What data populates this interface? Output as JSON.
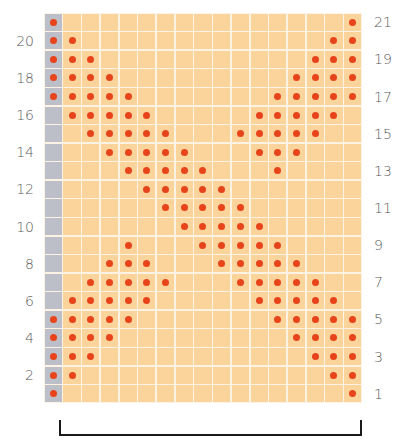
{
  "chart_data": {
    "type": "heatmap",
    "title": "",
    "rows_count": 21,
    "cols_count": 17,
    "edge_column": 0,
    "row_order": "top-to-bottom (row 21 first, row 1 last)",
    "rows": [
      {
        "row": 21,
        "pattern": "X...............X"
      },
      {
        "row": 20,
        "pattern": "XX.............XX"
      },
      {
        "row": 19,
        "pattern": "XXX...........XXX"
      },
      {
        "row": 18,
        "pattern": "XXXX.........XXXX"
      },
      {
        "row": 17,
        "pattern": "XXXXX.......XXXXX"
      },
      {
        "row": 16,
        "pattern": ".XXXXX.....XXXXX."
      },
      {
        "row": 15,
        "pattern": "..XXXXX...XXXXX.."
      },
      {
        "row": 14,
        "pattern": "...XXXXX...XXX..."
      },
      {
        "row": 13,
        "pattern": "....XXXXX...X...."
      },
      {
        "row": 12,
        "pattern": ".....XXXXX......."
      },
      {
        "row": 11,
        "pattern": "......XXXXX......"
      },
      {
        "row": 10,
        "pattern": ".......XXXXX....."
      },
      {
        "row": 9,
        "pattern": "....X...XXXXX...."
      },
      {
        "row": 8,
        "pattern": "...XXX...XXXXX..."
      },
      {
        "row": 7,
        "pattern": "..XXXXX...XXXXX.."
      },
      {
        "row": 6,
        "pattern": ".XXXXX.....XXXXX."
      },
      {
        "row": 5,
        "pattern": "XXXXX.......XXXXX"
      },
      {
        "row": 4,
        "pattern": "XXXX.........XXXX"
      },
      {
        "row": 3,
        "pattern": "XXX...........XXX"
      },
      {
        "row": 2,
        "pattern": "XX.............XX"
      },
      {
        "row": 1,
        "pattern": "X...............X"
      }
    ],
    "left_labels": [
      "20",
      "18",
      "16",
      "14",
      "12",
      "10",
      "8",
      "6",
      "4",
      "2"
    ],
    "right_labels": [
      "21",
      "19",
      "17",
      "15",
      "13",
      "11",
      "9",
      "7",
      "5",
      "3",
      "1"
    ],
    "legend": [],
    "colors": {
      "cell": "#fbd49b",
      "edge_cell": "#bcbfc7",
      "grid_line": "#fdf3e4",
      "dot": "#e8441c",
      "label": "#5a5a5a",
      "bracket": "#1a1a1a"
    },
    "annotations": [
      "bracket spanning repeat stitches beneath chart"
    ]
  }
}
